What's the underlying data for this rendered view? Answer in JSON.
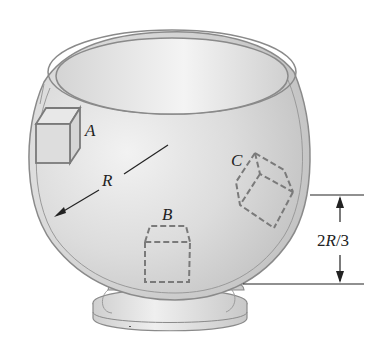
{
  "figure": {
    "labels": {
      "block_a": "A",
      "block_b": "B",
      "block_c": "C",
      "radius": "R",
      "height_prefix": "2",
      "height_var": "R",
      "height_suffix": "/3"
    },
    "dimension": {
      "quantity": "height of block C above bottom of bowl",
      "value": "2R/3"
    },
    "colors": {
      "bowl_fill": "#d9d9d9",
      "bowl_stroke": "#8a8a8a",
      "block_stroke": "#7a7a7a",
      "dim_line": "#222222"
    }
  }
}
